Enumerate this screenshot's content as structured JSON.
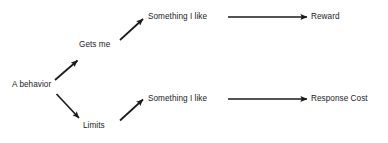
{
  "diagram": {
    "background_color": "#ffffff",
    "line_color": "#1a1a1a",
    "text_color": "#1c1c1c",
    "nodes": [
      {
        "id": "a-behavior",
        "label": "A behavior"
      },
      {
        "id": "gets-me",
        "label": "Gets me"
      },
      {
        "id": "limits",
        "label": "Limits"
      },
      {
        "id": "something-top",
        "label": "Something I like"
      },
      {
        "id": "something-bot",
        "label": "Something I like"
      },
      {
        "id": "reward",
        "label": "Reward"
      },
      {
        "id": "response-cost",
        "label": "Response Cost"
      }
    ],
    "edges": [
      {
        "id": "edge-behavior-to-gets-me",
        "from": "a-behavior",
        "to": "gets-me",
        "direction": "up-right"
      },
      {
        "id": "edge-behavior-to-limits",
        "from": "a-behavior",
        "to": "limits",
        "direction": "down-right"
      },
      {
        "id": "edge-gets-me-to-something",
        "from": "gets-me",
        "to": "something-top",
        "direction": "up-right"
      },
      {
        "id": "edge-limits-to-something",
        "from": "limits",
        "to": "something-bot",
        "direction": "up-right"
      },
      {
        "id": "edge-something-to-reward",
        "from": "something-top",
        "to": "reward",
        "direction": "right"
      },
      {
        "id": "edge-something-to-response-cost",
        "from": "something-bot",
        "to": "response-cost",
        "direction": "right"
      }
    ]
  }
}
